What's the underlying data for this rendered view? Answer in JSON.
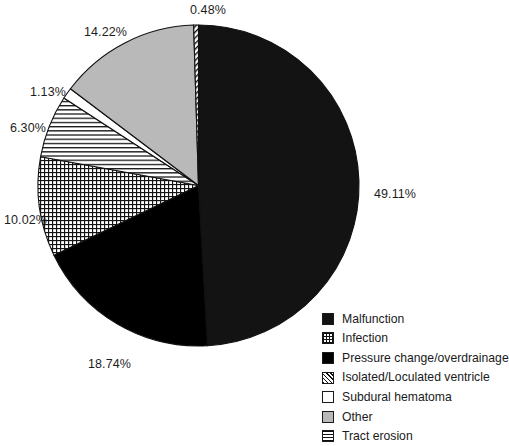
{
  "chart_data": {
    "type": "pie",
    "title": "",
    "subtitle": "",
    "xlabel": "",
    "ylabel": "",
    "legend_position": "bottom-right",
    "grid": false,
    "start_angle_deg": 0,
    "direction": "clockwise",
    "units": "percent",
    "categories": [
      "Malfunction",
      "Infection",
      "Pressure change/overdrainage",
      "Isolated/Loculated ventricle",
      "Subdural hematoma",
      "Other",
      "Tract erosion"
    ],
    "values": [
      49.11,
      10.02,
      18.74,
      6.3,
      1.13,
      14.22,
      0.48
    ],
    "slices": [
      {
        "label": "Malfunction",
        "value": 49.11,
        "value_text": "49.11%",
        "fill": "solid-dark",
        "color": "#131313",
        "label_x": 374,
        "label_y": 188
      },
      {
        "label": "Pressure change/overdrainage",
        "value": 18.74,
        "value_text": "18.74%",
        "fill": "solid-black",
        "color": "#000000",
        "label_x": 88,
        "label_y": 358
      },
      {
        "label": "Infection",
        "value": 10.02,
        "value_text": "10.02%",
        "fill": "grid",
        "color": "#ffffff",
        "label_x": 4,
        "label_y": 214
      },
      {
        "label": "Isolated/Loculated ventricle",
        "value": 6.3,
        "value_text": "6.30%",
        "fill": "horizontal-lines",
        "color": "#ffffff",
        "label_x": 10,
        "label_y": 122
      },
      {
        "label": "Subdural hematoma",
        "value": 1.13,
        "value_text": "1.13%",
        "fill": "white",
        "color": "#ffffff",
        "label_x": 30,
        "label_y": 86
      },
      {
        "label": "Other",
        "value": 14.22,
        "value_text": "14.22%",
        "fill": "gray",
        "color": "#b9b9b9",
        "label_x": 84,
        "label_y": 26
      },
      {
        "label": "Tract erosion",
        "value": 0.48,
        "value_text": "0.48%",
        "fill": "diagonal-hatch",
        "color": "#ffffff",
        "label_x": 190,
        "label_y": 4
      }
    ]
  },
  "legend": {
    "items": [
      {
        "label": "Malfunction",
        "swatch": "solid-dark"
      },
      {
        "label": "Infection",
        "swatch": "grid"
      },
      {
        "label": "Pressure change/overdrainage",
        "swatch": "solid-black"
      },
      {
        "label": "Isolated/Loculated ventricle",
        "swatch": "diagonal-hatch"
      },
      {
        "label": "Subdural hematoma",
        "swatch": "white"
      },
      {
        "label": "Other",
        "swatch": "gray"
      },
      {
        "label": "Tract erosion",
        "swatch": "horizontal-lines"
      }
    ]
  }
}
